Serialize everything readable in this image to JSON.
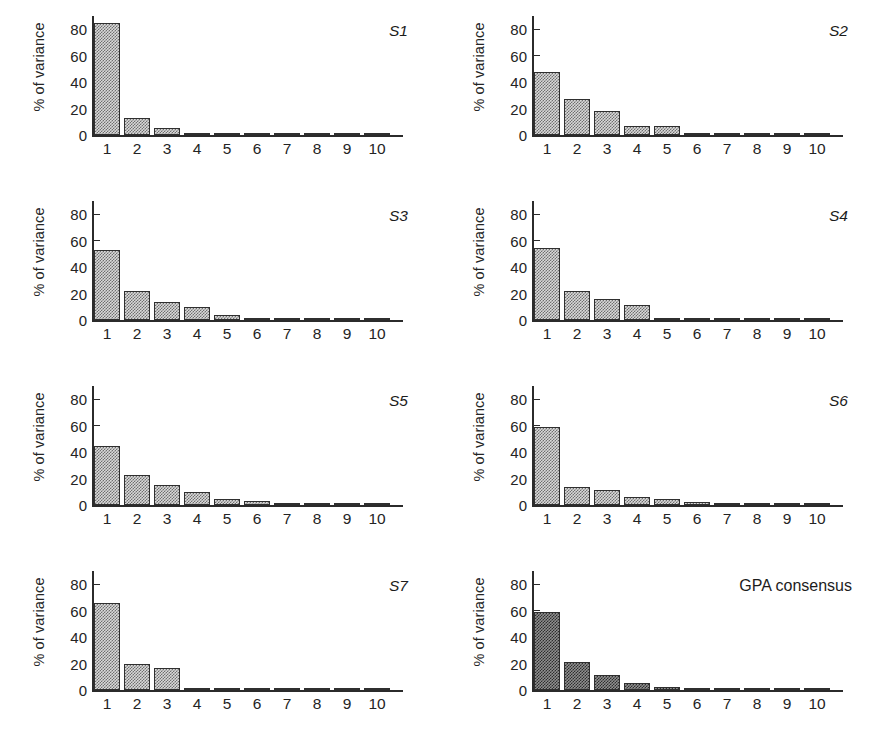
{
  "figure": {
    "rows": 4,
    "cols": 2,
    "background": "#ffffff",
    "bar_fill_color": "#d9d9d9",
    "bar_fill_color_dark": "#8f8f8f",
    "bar_edge_color": "#2f2f2f",
    "axis_color": "#2b2b2b"
  },
  "chart_data": [
    {
      "type": "bar",
      "title": "S1",
      "title_style": "italic",
      "xlabel": "",
      "ylabel": "% of variance",
      "categories": [
        "1",
        "2",
        "3",
        "4",
        "5",
        "6",
        "7",
        "8",
        "9",
        "10"
      ],
      "values": [
        84.5,
        12.5,
        5.0,
        1.0,
        1.0,
        1.0,
        1.0,
        1.0,
        0.6,
        0.6
      ],
      "ylim": [
        0,
        90
      ],
      "yticks": [
        0,
        20,
        40,
        60,
        80
      ],
      "grid": false,
      "legend": "none"
    },
    {
      "type": "bar",
      "title": "S2",
      "title_style": "italic",
      "xlabel": "",
      "ylabel": "% of variance",
      "categories": [
        "1",
        "2",
        "3",
        "4",
        "5",
        "6",
        "7",
        "8",
        "9",
        "10"
      ],
      "values": [
        47.5,
        27.0,
        18.5,
        7.0,
        6.5,
        1.2,
        1.0,
        1.0,
        0.8,
        0.6
      ],
      "ylim": [
        0,
        90
      ],
      "yticks": [
        0,
        20,
        40,
        60,
        80
      ],
      "grid": false,
      "legend": "none"
    },
    {
      "type": "bar",
      "title": "S3",
      "title_style": "italic",
      "xlabel": "",
      "ylabel": "% of variance",
      "categories": [
        "1",
        "2",
        "3",
        "4",
        "5",
        "6",
        "7",
        "8",
        "9",
        "10"
      ],
      "values": [
        53.0,
        22.0,
        13.5,
        9.5,
        4.0,
        1.2,
        0.8,
        0.8,
        0.6,
        0.6
      ],
      "ylim": [
        0,
        90
      ],
      "yticks": [
        0,
        20,
        40,
        60,
        80
      ],
      "grid": false,
      "legend": "none"
    },
    {
      "type": "bar",
      "title": "S4",
      "title_style": "italic",
      "xlabel": "",
      "ylabel": "% of variance",
      "categories": [
        "1",
        "2",
        "3",
        "4",
        "5",
        "6",
        "7",
        "8",
        "9",
        "10"
      ],
      "values": [
        54.5,
        22.0,
        16.0,
        11.5,
        0.9,
        0.9,
        0.8,
        0.8,
        0.6,
        0.6
      ],
      "ylim": [
        0,
        90
      ],
      "yticks": [
        0,
        20,
        40,
        60,
        80
      ],
      "grid": false,
      "legend": "none"
    },
    {
      "type": "bar",
      "title": "S5",
      "title_style": "italic",
      "xlabel": "",
      "ylabel": "% of variance",
      "categories": [
        "1",
        "2",
        "3",
        "4",
        "5",
        "6",
        "7",
        "8",
        "9",
        "10"
      ],
      "values": [
        45.0,
        23.0,
        15.5,
        10.0,
        4.5,
        3.0,
        0.8,
        0.7,
        0.6,
        0.6
      ],
      "ylim": [
        0,
        90
      ],
      "yticks": [
        0,
        20,
        40,
        60,
        80
      ],
      "grid": false,
      "legend": "none"
    },
    {
      "type": "bar",
      "title": "S6",
      "title_style": "italic",
      "xlabel": "",
      "ylabel": "% of variance",
      "categories": [
        "1",
        "2",
        "3",
        "4",
        "5",
        "6",
        "7",
        "8",
        "9",
        "10"
      ],
      "values": [
        59.0,
        13.5,
        11.5,
        6.0,
        4.5,
        2.5,
        1.8,
        1.2,
        1.0,
        1.0
      ],
      "ylim": [
        0,
        90
      ],
      "yticks": [
        0,
        20,
        40,
        60,
        80
      ],
      "grid": false,
      "legend": "none"
    },
    {
      "type": "bar",
      "title": "S7",
      "title_style": "italic",
      "xlabel": "",
      "ylabel": "% of variance",
      "categories": [
        "1",
        "2",
        "3",
        "4",
        "5",
        "6",
        "7",
        "8",
        "9",
        "10"
      ],
      "values": [
        66.0,
        20.0,
        16.5,
        1.0,
        0.5,
        0.5,
        0.5,
        0.5,
        0.4,
        0.4
      ],
      "ylim": [
        0,
        90
      ],
      "yticks": [
        0,
        20,
        40,
        60,
        80
      ],
      "grid": false,
      "legend": "none"
    },
    {
      "type": "bar",
      "title": "GPA consensus",
      "title_style": "normal",
      "xlabel": "",
      "ylabel": "% of variance",
      "categories": [
        "1",
        "2",
        "3",
        "4",
        "5",
        "6",
        "7",
        "8",
        "9",
        "10"
      ],
      "values": [
        59.0,
        21.5,
        11.5,
        5.0,
        2.0,
        1.2,
        1.0,
        1.0,
        0.8,
        0.7
      ],
      "ylim": [
        0,
        90
      ],
      "yticks": [
        0,
        20,
        40,
        60,
        80
      ],
      "grid": false,
      "legend": "none"
    }
  ]
}
